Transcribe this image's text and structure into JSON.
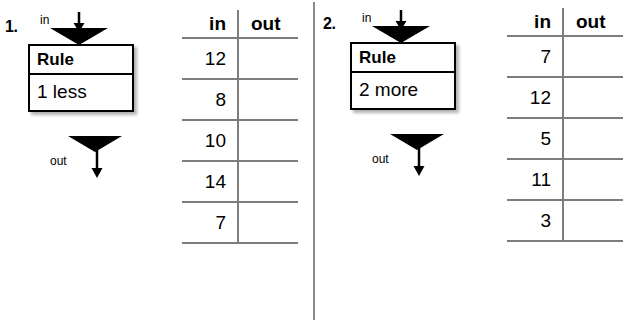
{
  "page": {
    "background_color": "#ffffff",
    "line_color": "#7d7d7d",
    "divider_color": "#8a8a8a",
    "ink_color": "#000000"
  },
  "problems": [
    {
      "number": "1.",
      "machine": {
        "in_label": "in",
        "out_label": "out",
        "rule_title": "Rule",
        "rule_body": "1 less"
      },
      "table": {
        "headers": {
          "in": "in",
          "out": "out"
        },
        "rows": [
          {
            "in": "12",
            "out": ""
          },
          {
            "in": "8",
            "out": ""
          },
          {
            "in": "10",
            "out": ""
          },
          {
            "in": "14",
            "out": ""
          },
          {
            "in": "7",
            "out": ""
          }
        ]
      }
    },
    {
      "number": "2.",
      "machine": {
        "in_label": "in",
        "out_label": "out",
        "rule_title": "Rule",
        "rule_body": "2 more"
      },
      "table": {
        "headers": {
          "in": "in",
          "out": "out"
        },
        "rows": [
          {
            "in": "7",
            "out": ""
          },
          {
            "in": "12",
            "out": ""
          },
          {
            "in": "5",
            "out": ""
          },
          {
            "in": "11",
            "out": ""
          },
          {
            "in": "3",
            "out": ""
          }
        ]
      }
    }
  ]
}
